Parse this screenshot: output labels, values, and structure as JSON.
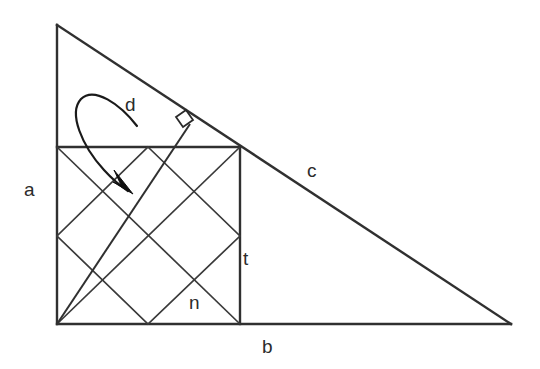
{
  "figure": {
    "background_color": "#ffffff",
    "stroke_color": "#303030",
    "inner_stroke_color": "#3a3a3a",
    "arrow_color": "#101010",
    "width": 540,
    "height": 369
  },
  "labels": {
    "a": "a",
    "b": "b",
    "c": "c",
    "d": "d",
    "t": "t",
    "n": "n"
  },
  "geometry": {
    "triangle": {
      "name": "right-triangle",
      "apex": [
        57,
        25
      ],
      "right_angle_vertex": [
        57,
        324
      ],
      "base_right_vertex": [
        511,
        324
      ],
      "leg_vertical_label": "a",
      "leg_horizontal_label": "b",
      "hypotenuse_label": "c"
    },
    "square": {
      "name": "inscribed-square",
      "top_left": [
        57,
        147
      ],
      "top_right": [
        240,
        147
      ],
      "bottom_right": [
        240,
        324
      ],
      "bottom_left": [
        57,
        324
      ],
      "side_label": "t"
    },
    "inner_diamond": {
      "name": "midpoint-diamond",
      "vertices": [
        [
          148,
          147
        ],
        [
          240,
          236
        ],
        [
          148,
          324
        ],
        [
          57,
          236
        ]
      ],
      "label": "n"
    },
    "corner_diagonals": [
      {
        "from": [
          57,
          147
        ],
        "to": [
          240,
          324
        ]
      },
      {
        "from": [
          57,
          324
        ],
        "to": [
          240,
          147
        ]
      }
    ],
    "perpendicular": {
      "name": "perpendicular-segment",
      "from": [
        57,
        324
      ],
      "to": [
        190,
        124
      ],
      "right_angle_marker_at": [
        183,
        114
      ],
      "label": "d"
    },
    "curved_arrow": {
      "name": "annotation-arrow-d",
      "start": [
        137,
        126
      ],
      "loop_apex": [
        84,
        94
      ],
      "tip": [
        131,
        190
      ]
    }
  }
}
